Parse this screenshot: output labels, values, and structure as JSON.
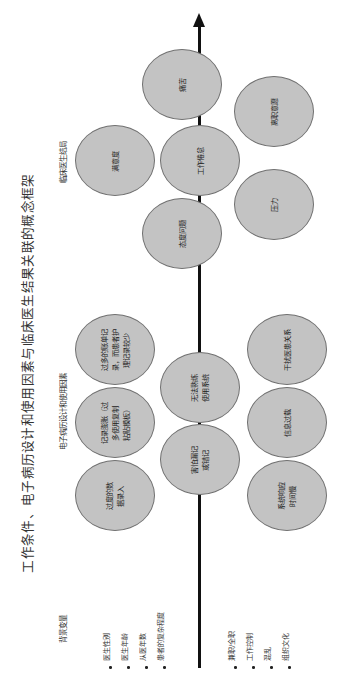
{
  "title": "工作条件、电子病历设计和使用因素与临床医生结果关联的概念框架",
  "sections": {
    "outcomes": "临床医生结局",
    "ehr_factors": "电子病历设计和使用因素",
    "background": "背景变量"
  },
  "outcomes": [
    {
      "id": "distress",
      "label": "痛苦"
    },
    {
      "id": "satisfaction",
      "label": "满意度"
    },
    {
      "id": "burnout",
      "label": "工作倦怠"
    },
    {
      "id": "intent_to_leave",
      "label": "离职意愿"
    },
    {
      "id": "attitude",
      "label": "态度问题"
    },
    {
      "id": "stress",
      "label": "压力"
    }
  ],
  "ehr_factors": [
    {
      "id": "excess_billing",
      "label": "过多的账单记\n录，而患者护\n理记录较少"
    },
    {
      "id": "note_bloat",
      "label": "记录膨胀（过\n多使用复制\n粘贴模板）"
    },
    {
      "id": "excess_data_entry",
      "label": "过度的数\n据录入"
    },
    {
      "id": "not_proficient",
      "label": "无法熟练\n使用系统"
    },
    {
      "id": "fear_errors",
      "label": "害怕漏记\n或错记"
    },
    {
      "id": "interferes_relationship",
      "label": "干扰医患关系"
    },
    {
      "id": "info_overload",
      "label": "信息过载"
    },
    {
      "id": "slow_response",
      "label": "系统响应\n时间慢"
    }
  ],
  "background_variables": [
    "医生性别",
    "医生年龄",
    "从医年数",
    "患者的复杂程度"
  ],
  "work_conditions": [
    "兼职/全职",
    "工作控制",
    "混乱",
    "组织文化"
  ],
  "colors": {
    "ellipse_fill": "#c3c3c3",
    "ellipse_border": "#707070",
    "axis": "#111111"
  }
}
